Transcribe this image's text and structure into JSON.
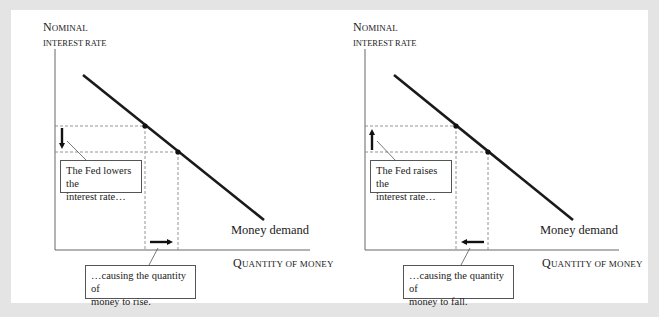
{
  "panels": [
    {
      "id": "left",
      "y_axis_label_line1_cap": "N",
      "y_axis_label_line1_rest": "OMINAL",
      "y_axis_label_line2": "INTEREST RATE",
      "x_axis_label_cap": "Q",
      "x_axis_label_rest": "UANTITY OF MONEY",
      "curve_label": "Money demand",
      "rate_callout": "The Fed lowers the interest rate…",
      "rate_callout_line1": "The Fed lowers the",
      "rate_callout_line2": "interest rate…",
      "quantity_callout_line1": "…causing the quantity of",
      "quantity_callout_line2": "money to rise.",
      "rate_arrow_direction": "down",
      "quantity_arrow_direction": "right"
    },
    {
      "id": "right",
      "y_axis_label_line1_cap": "N",
      "y_axis_label_line1_rest": "OMINAL",
      "y_axis_label_line2": "INTEREST RATE",
      "x_axis_label_cap": "Q",
      "x_axis_label_rest": "UANTITY OF MONEY",
      "curve_label": "Money demand",
      "rate_callout": "The Fed raises the interest rate…",
      "rate_callout_line1": "The Fed raises the",
      "rate_callout_line2": "interest rate…",
      "quantity_callout_line1": "…causing the quantity of",
      "quantity_callout_line2": "money to fall.",
      "rate_arrow_direction": "up",
      "quantity_arrow_direction": "left"
    }
  ],
  "colors": {
    "frame": "#e4e4e4",
    "background": "#ffffff",
    "curve": "#1a1a1a",
    "axis": "#555555",
    "guide": "#888888"
  }
}
